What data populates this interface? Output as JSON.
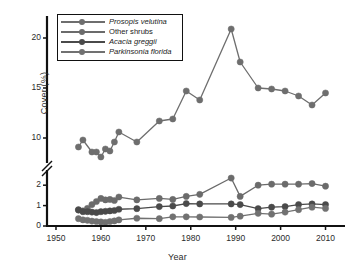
{
  "chart_data": {
    "type": "line",
    "title": "",
    "xlabel": "Year",
    "ylabel": "Cover (%)",
    "xlim": [
      1948,
      2013
    ],
    "xticks": [
      1950,
      1960,
      1970,
      1980,
      1990,
      2000,
      2010
    ],
    "broken_axis": true,
    "axis_break_marker": "//",
    "lower_panel": {
      "ylim": [
        0,
        2.45
      ],
      "yticks": [
        0,
        1,
        2
      ]
    },
    "upper_panel": {
      "ylim": [
        8.0,
        21.6
      ],
      "yticks": [
        10,
        15,
        20
      ]
    },
    "grid": false,
    "legend_position": "top-left",
    "series": [
      {
        "name": "Prosopis velutina",
        "italic": true,
        "color": "#6e6e6e",
        "panel": "upper",
        "points": [
          [
            1955,
            9.1
          ],
          [
            1956,
            9.8
          ],
          [
            1958,
            8.6
          ],
          [
            1959,
            8.6
          ],
          [
            1960,
            8.1
          ],
          [
            1961,
            8.9
          ],
          [
            1962,
            8.7
          ],
          [
            1963,
            9.6
          ],
          [
            1964,
            10.6
          ],
          [
            1968,
            9.6
          ],
          [
            1973,
            11.7
          ],
          [
            1976,
            11.9
          ],
          [
            1979,
            14.7
          ],
          [
            1982,
            13.8
          ],
          [
            1989,
            20.9
          ],
          [
            1991,
            17.6
          ],
          [
            1995,
            15.0
          ],
          [
            1998,
            14.9
          ],
          [
            2001,
            14.7
          ],
          [
            2004,
            14.2
          ],
          [
            2007,
            13.3
          ],
          [
            2010,
            14.5
          ]
        ]
      },
      {
        "name": "Other shrubs",
        "italic": false,
        "color": "#6b6b6b",
        "panel": "lower",
        "points": [
          [
            1955,
            0.8
          ],
          [
            1956,
            0.74
          ],
          [
            1957,
            0.86
          ],
          [
            1958,
            1.05
          ],
          [
            1959,
            1.2
          ],
          [
            1960,
            1.35
          ],
          [
            1961,
            1.28
          ],
          [
            1962,
            1.3
          ],
          [
            1963,
            1.25
          ],
          [
            1964,
            1.42
          ],
          [
            1968,
            1.28
          ],
          [
            1973,
            1.35
          ],
          [
            1976,
            1.3
          ],
          [
            1979,
            1.45
          ],
          [
            1982,
            1.55
          ],
          [
            1989,
            2.35
          ],
          [
            1991,
            1.45
          ],
          [
            1995,
            2.0
          ],
          [
            1998,
            2.05
          ],
          [
            2001,
            2.05
          ],
          [
            2004,
            2.05
          ],
          [
            2007,
            2.08
          ],
          [
            2010,
            1.95
          ]
        ]
      },
      {
        "name": "Acacia greggii",
        "italic": true,
        "color": "#4a4a4a",
        "panel": "lower",
        "points": [
          [
            1955,
            0.78
          ],
          [
            1956,
            0.7
          ],
          [
            1957,
            0.7
          ],
          [
            1958,
            0.68
          ],
          [
            1959,
            0.66
          ],
          [
            1960,
            0.7
          ],
          [
            1961,
            0.72
          ],
          [
            1962,
            0.74
          ],
          [
            1963,
            0.76
          ],
          [
            1964,
            0.82
          ],
          [
            1968,
            0.85
          ],
          [
            1973,
            0.95
          ],
          [
            1976,
            0.98
          ],
          [
            1979,
            1.1
          ],
          [
            1982,
            1.08
          ],
          [
            1989,
            1.08
          ],
          [
            1991,
            1.05
          ],
          [
            1995,
            0.85
          ],
          [
            1998,
            0.92
          ],
          [
            2001,
            0.95
          ],
          [
            2004,
            1.05
          ],
          [
            2007,
            1.08
          ],
          [
            2010,
            1.05
          ]
        ]
      },
      {
        "name": "Parkinsonia florida",
        "italic": true,
        "color": "#717171",
        "panel": "lower",
        "points": [
          [
            1955,
            0.36
          ],
          [
            1956,
            0.3
          ],
          [
            1957,
            0.28
          ],
          [
            1958,
            0.24
          ],
          [
            1959,
            0.22
          ],
          [
            1960,
            0.2
          ],
          [
            1961,
            0.18
          ],
          [
            1962,
            0.22
          ],
          [
            1963,
            0.25
          ],
          [
            1964,
            0.3
          ],
          [
            1968,
            0.38
          ],
          [
            1973,
            0.36
          ],
          [
            1976,
            0.45
          ],
          [
            1979,
            0.45
          ],
          [
            1982,
            0.44
          ],
          [
            1989,
            0.42
          ],
          [
            1991,
            0.48
          ],
          [
            1995,
            0.62
          ],
          [
            1998,
            0.58
          ],
          [
            2001,
            0.68
          ],
          [
            2004,
            0.8
          ],
          [
            2007,
            0.92
          ],
          [
            2010,
            0.86
          ]
        ]
      }
    ]
  },
  "legend": {
    "items": [
      {
        "label": "Prosopis velutina"
      },
      {
        "label": "Other shrubs"
      },
      {
        "label": "Acacia greggii"
      },
      {
        "label": "Parkinsonia florida"
      }
    ]
  },
  "axes": {
    "y_title": "Cover (%)",
    "x_title": "Year",
    "y_ticks_upper": [
      "20",
      "15",
      "10"
    ],
    "y_ticks_lower": [
      "2",
      "1",
      "0"
    ],
    "x_ticks": [
      "1950",
      "1960",
      "1970",
      "1980",
      "1990",
      "2000",
      "2010"
    ]
  }
}
